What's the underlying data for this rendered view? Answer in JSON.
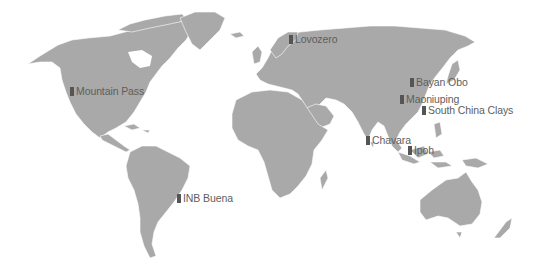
{
  "map": {
    "land_color": "#a9a9a9",
    "border_color": "#ffffff",
    "marker_color": "#555555",
    "label_color": "#5e5e5e"
  },
  "sites": [
    {
      "name": "Lovozero",
      "x": 291,
      "y": 34
    },
    {
      "name": "Mountain Pass",
      "x": 72,
      "y": 86
    },
    {
      "name": "Bayan Obo",
      "x": 412,
      "y": 77
    },
    {
      "name": "Maoniuping",
      "x": 401,
      "y": 94
    },
    {
      "name": "South China Clays",
      "x": 423,
      "y": 105
    },
    {
      "name": "Chavara",
      "x": 367,
      "y": 135
    },
    {
      "name": "Ipoh",
      "x": 409,
      "y": 145
    },
    {
      "name": "INB Buena",
      "x": 178,
      "y": 192
    }
  ]
}
